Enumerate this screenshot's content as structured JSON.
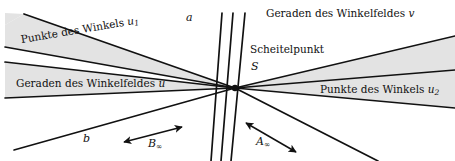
{
  "figure": {
    "kind": "geometry-diagram",
    "background_color": "#ffffff",
    "band_fill_color": "#e2e2e2",
    "line_color": "#111111",
    "width": 455,
    "height": 161,
    "vertex": {
      "name": "S",
      "x": 235,
      "y": 88
    }
  },
  "labels": {
    "line_a": "a",
    "line_b": "b",
    "points_of_angle_u1_prefix": "Punkte des Winkels ",
    "points_of_angle_u1_sym": "u",
    "points_of_angle_u1_sub": "1",
    "lines_of_angle_field_u_prefix": "Geraden des Winkelfeldes ",
    "lines_of_angle_field_u_sym": "u",
    "lines_of_angle_field_v_prefix": "Geraden des Winkelfeldes ",
    "lines_of_angle_field_v_sym": "v",
    "vertex_word": "Scheitelpunkt",
    "vertex_sym": "S",
    "points_of_angle_u2_prefix": "Punkte des Winkels ",
    "points_of_angle_u2_sym": "u",
    "points_of_angle_u2_sub": "2",
    "arrow_b_sym": "B",
    "arrow_b_sub": "∞",
    "arrow_a_sym": "A",
    "arrow_a_sub": "∞"
  },
  "geometry": {
    "left_fan_lines": [
      {
        "name": "ray-a",
        "x1": 235,
        "y1": 88,
        "x2": 24,
        "y2": 14
      },
      {
        "name": "ray-u1-upper",
        "x1": 235,
        "y1": 88,
        "x2": 5,
        "y2": 47
      },
      {
        "name": "ray-u-boundary",
        "x1": 235,
        "y1": 88,
        "x2": 5,
        "y2": 62
      },
      {
        "name": "ray-u-lower",
        "x1": 235,
        "y1": 88,
        "x2": 5,
        "y2": 98
      },
      {
        "name": "ray-b",
        "x1": 235,
        "y1": 88,
        "x2": 14,
        "y2": 150
      }
    ],
    "right_fan_lines": [
      {
        "name": "ray-v-upper",
        "x1": 235,
        "y1": 88,
        "x2": 452,
        "y2": 36
      },
      {
        "name": "ray-u2-upper",
        "x1": 235,
        "y1": 88,
        "x2": 452,
        "y2": 70
      },
      {
        "name": "ray-u2-lower",
        "x1": 235,
        "y1": 88,
        "x2": 452,
        "y2": 108
      },
      {
        "name": "ray-right-lowest",
        "x1": 235,
        "y1": 88,
        "x2": 376,
        "y2": 161
      }
    ],
    "steep_lines": [
      {
        "name": "steep-line-1",
        "x1": 222,
        "y1": 13,
        "x2": 211,
        "y2": 161
      },
      {
        "name": "steep-line-2",
        "x1": 233,
        "y1": 13,
        "x2": 221,
        "y2": 161
      },
      {
        "name": "steep-line-3",
        "x1": 245,
        "y1": 13,
        "x2": 231,
        "y2": 161
      }
    ],
    "bands": [
      {
        "name": "band-u1",
        "points": "235,88 24,14 5,26 5,47"
      },
      {
        "name": "band-u",
        "points": "235,88 5,62 5,98"
      },
      {
        "name": "band-u2",
        "points": "235,88 452,70 452,108"
      },
      {
        "name": "band-v-upper",
        "points": "235,88 452,36 455,60 452,70"
      }
    ],
    "arrows": [
      {
        "name": "arrow-b-infinity",
        "x1": 124,
        "y1": 142,
        "x2": 182,
        "y2": 128
      },
      {
        "name": "arrow-a-infinity",
        "x1": 245,
        "y1": 124,
        "x2": 296,
        "y2": 152
      }
    ]
  },
  "label_positions": {
    "line_a": {
      "x": 186,
      "y": 16
    },
    "line_b": {
      "x": 83,
      "y": 139
    },
    "u1": {
      "x": 24,
      "y": 38
    },
    "u_field": {
      "x": 16,
      "y": 82
    },
    "v_field": {
      "x": 267,
      "y": 11
    },
    "vertex": {
      "x": 251,
      "y": 48
    },
    "vertexS": {
      "x": 251,
      "y": 65
    },
    "u2": {
      "x": 321,
      "y": 88
    },
    "b_inf": {
      "x": 148,
      "y": 143
    },
    "a_inf": {
      "x": 256,
      "y": 140
    }
  }
}
